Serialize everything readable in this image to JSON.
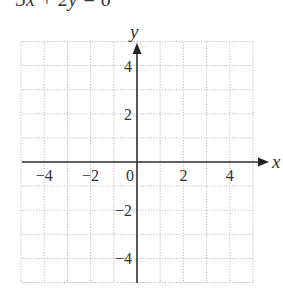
{
  "header": {
    "equation_partial": "3x + 2y = 6"
  },
  "chart_data": {
    "type": "scatter",
    "title": "",
    "xlabel": "x",
    "ylabel": "y",
    "xlim": [
      -5,
      5
    ],
    "ylim": [
      -5,
      5
    ],
    "grid": true,
    "grid_style": "dotted",
    "x_ticks": [
      -4,
      -2,
      0,
      2,
      4
    ],
    "y_ticks": [
      -4,
      -2,
      2,
      4
    ],
    "x_tick_labels": [
      "−4",
      "−2",
      "0",
      "2",
      "4"
    ],
    "y_tick_labels": [
      "−4",
      "−2",
      "2",
      "4"
    ],
    "series": [],
    "legend": null
  }
}
